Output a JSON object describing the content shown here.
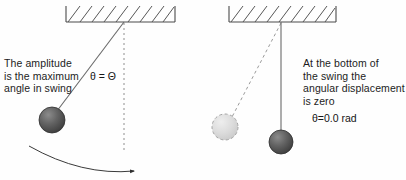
{
  "figure": {
    "background_color": "#fefefe",
    "ink_color": "#3f3f3f",
    "text_color": "#1c1c1c"
  },
  "panels": {
    "left": {
      "caption": "The amplitude\nis the maximum\nangle in swing",
      "angle_label": "θ = Θ",
      "ceiling": {
        "x": 66,
        "y": 5,
        "width": 109,
        "height": 17
      },
      "pivot": {
        "x": 124,
        "y": 22
      },
      "bob": {
        "cx": 52,
        "cy": 120,
        "r": 13,
        "fill": "#555555",
        "style": "solid"
      },
      "reference_line": {
        "style": "dashed",
        "x": 124,
        "y1": 22,
        "y2": 150
      },
      "rod": {
        "style": "solid",
        "x1": 124,
        "y1": 22,
        "x2": 56,
        "y2": 112
      },
      "swing_arrow": {
        "from": [
          30,
          148
        ],
        "to": [
          140,
          172
        ],
        "style": "curved-arrow"
      }
    },
    "right": {
      "caption": "At the bottom of\nthe swing the\nangular displacement\nis zero",
      "angle_label": "θ=0.0 rad",
      "ceiling": {
        "x": 229,
        "y": 5,
        "width": 107,
        "height": 17
      },
      "pivot": {
        "x": 281,
        "y": 22
      },
      "bob": {
        "cx": 281,
        "cy": 142,
        "r": 12,
        "fill": "#555555",
        "style": "solid"
      },
      "ghost_bob": {
        "cx": 225,
        "cy": 127,
        "r": 13,
        "fill": "#d8d8d8",
        "style": "dashed-outline"
      },
      "rod": {
        "style": "solid",
        "x1": 281,
        "y1": 22,
        "x2": 281,
        "y2": 130
      },
      "ghost_rod": {
        "style": "dashed",
        "x1": 281,
        "y1": 22,
        "x2": 231,
        "y2": 117
      }
    }
  }
}
